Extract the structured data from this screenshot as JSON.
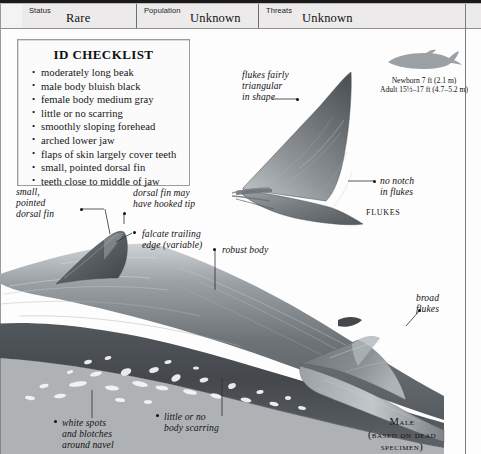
{
  "header": {
    "fields": [
      {
        "key": "Status",
        "value": "Rare"
      },
      {
        "key": "Population",
        "value": "Unknown"
      },
      {
        "key": "Threats",
        "value": "Unknown"
      }
    ]
  },
  "checklist": {
    "title": "ID CHECKLIST",
    "items": [
      "moderately long beak",
      "male body bluish black",
      "female body medium gray",
      "little or no scarring",
      "smoothly sloping forehead",
      "arched lower jaw",
      "flaps of skin largely cover teeth",
      "small, pointed dorsal fin",
      "teeth close to middle of jaw"
    ]
  },
  "size_note": {
    "newborn": "Newborn 7 ft (2.1 m)",
    "adult": "Adult 15½–17 ft (4.7–5.2 m)"
  },
  "annotations": {
    "flukes_triangular": "flukes fairly\ntriangular\nin shape",
    "flukes_triangular_lines": [
      "flukes fairly",
      "triangular",
      "in shape"
    ],
    "no_notch": [
      "no notch",
      "in flukes"
    ],
    "small_pointed_dorsal": [
      "small,",
      "pointed",
      "dorsal fin"
    ],
    "hooked_tip": [
      "dorsal fin may",
      "have hooked tip"
    ],
    "falcate": [
      "falcate trailing",
      "edge (variable)"
    ],
    "robust_body": [
      "robust body"
    ],
    "broad_flukes": [
      "broad",
      "flukes"
    ],
    "white_spots": [
      "white spots",
      "and blotches",
      "around navel"
    ],
    "no_scarring": [
      "little or no",
      "body scarring"
    ]
  },
  "captions": {
    "flukes": "Flukes",
    "male": "Male",
    "male_sub1": "(based on dead",
    "male_sub2": "specimen)"
  },
  "colors": {
    "ink": "#111111",
    "rule": "#1a1a1a",
    "header_bg": "#eceaea",
    "body_dark": "#5b5f63",
    "body_mid": "#8a8f93",
    "body_light": "#c6cacd",
    "silhouette": "#9aa0a4"
  }
}
